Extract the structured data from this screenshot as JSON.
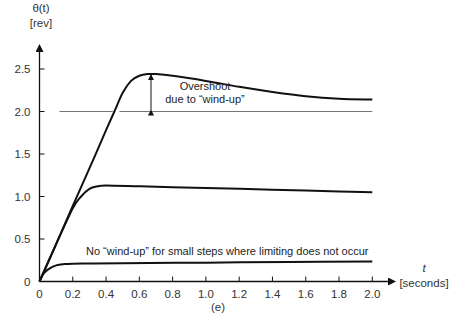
{
  "chart_data": {
    "type": "line",
    "title": "",
    "caption": "(e)",
    "xlabel": "t",
    "xlabel_units": "[seconds]",
    "ylabel": "θ(t)",
    "ylabel_units": "[rev]",
    "xlim": [
      0,
      2.1
    ],
    "ylim": [
      0,
      2.7
    ],
    "grid": false,
    "legend": "none",
    "x_ticks": [
      "0",
      "0.2",
      "0.4",
      "0.6",
      "0.8",
      "1.0",
      "1.2",
      "1.4",
      "1.6",
      "1.8",
      "2.0"
    ],
    "y_ticks": [
      "0",
      "0.5",
      "1.0",
      "1.5",
      "2.0",
      "2.5"
    ],
    "reference_lines": [
      {
        "name": "setpoint-2.0",
        "y": 2.0,
        "x_range": [
          0.12,
          2.0
        ],
        "color": "#777777"
      }
    ],
    "series": [
      {
        "name": "Large step (2.0 rev) with wind-up",
        "x": [
          0,
          0.1,
          0.2,
          0.3,
          0.4,
          0.45,
          0.5,
          0.55,
          0.6,
          0.65,
          0.7,
          0.8,
          1.0,
          1.2,
          1.4,
          1.6,
          1.8,
          2.0
        ],
        "y": [
          0,
          0.44,
          0.89,
          1.33,
          1.78,
          2.0,
          2.22,
          2.36,
          2.42,
          2.44,
          2.44,
          2.42,
          2.36,
          2.29,
          2.23,
          2.18,
          2.15,
          2.14
        ]
      },
      {
        "name": "Medium step (1.0 rev)",
        "x": [
          0,
          0.1,
          0.2,
          0.25,
          0.3,
          0.35,
          0.4,
          0.6,
          0.8,
          1.0,
          1.2,
          1.4,
          1.6,
          1.8,
          2.0
        ],
        "y": [
          0,
          0.44,
          0.86,
          1.0,
          1.09,
          1.12,
          1.13,
          1.12,
          1.11,
          1.1,
          1.09,
          1.08,
          1.07,
          1.06,
          1.05
        ]
      },
      {
        "name": "Small step (no limiting)",
        "x": [
          0,
          0.02,
          0.05,
          0.1,
          0.15,
          0.2,
          0.3,
          0.5,
          1.0,
          1.5,
          2.0
        ],
        "y": [
          0,
          0.08,
          0.14,
          0.19,
          0.205,
          0.21,
          0.212,
          0.215,
          0.222,
          0.23,
          0.235
        ]
      }
    ],
    "annotations": [
      {
        "text_line1": "Overshoot",
        "text_line2": "due to “wind-up”",
        "x": 0.67,
        "y_from": 2.0,
        "y_to": 2.44,
        "type": "double-arrow"
      },
      {
        "text": "No “wind-up” for small steps where limiting does not occur",
        "x": 0.4,
        "y": 0.4
      }
    ]
  },
  "labels": {
    "y_axis_title": "θ(t)",
    "y_axis_units": "[rev]",
    "x_axis_title": "t",
    "x_axis_units": "[seconds]",
    "caption": "(e)",
    "overshoot_line1": "Overshoot",
    "overshoot_line2": "due to “wind-up”",
    "small_step_note": "No “wind-up” for small steps where limiting does not occur"
  }
}
